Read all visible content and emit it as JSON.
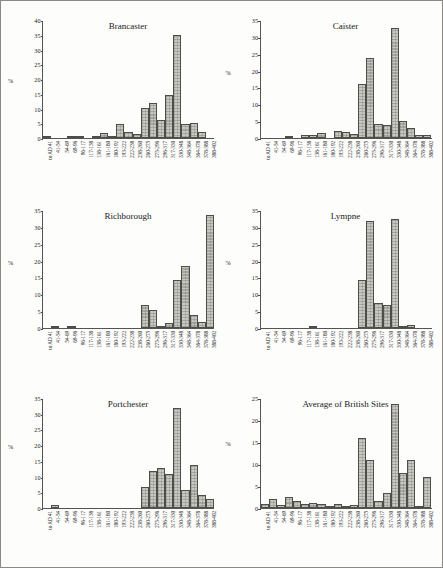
{
  "figure": {
    "background": "#fdfdfc",
    "border_color": "#8a8a82",
    "bar_fill": "#c8c8c2",
    "bar_edge": "#4e4e48",
    "axis_color": "#55554f"
  },
  "categories": [
    "to AD 41",
    "41-54",
    "54-69",
    "69-96",
    "96-117",
    "117-138",
    "138-161",
    "161-180",
    "180-192",
    "193-222",
    "222-238",
    "238-260",
    "260-275",
    "275-296",
    "296-317",
    "317-330",
    "330-348",
    "348-364",
    "364-378",
    "378-388",
    "388-402"
  ],
  "panels": [
    {
      "id": "brancaster",
      "title": "Brancaster",
      "ylabel": "%",
      "ylabel_at": 20,
      "ylim": [
        0,
        40
      ],
      "yticks": [
        0,
        5,
        10,
        15,
        20,
        25,
        30,
        35,
        40
      ],
      "values": [
        0.2,
        0,
        0,
        0.5,
        0.7,
        0,
        0.8,
        1.6,
        0.7,
        4.6,
        2.0,
        1.4,
        10.1,
        12.0,
        6.2,
        14.7,
        35.0,
        4.8,
        5.0,
        2.1,
        0
      ]
    },
    {
      "id": "caister",
      "title": "Caister",
      "ylabel": "%",
      "ylabel_at": 20,
      "ylim": [
        0,
        35
      ],
      "yticks": [
        0,
        5,
        10,
        15,
        20,
        25,
        30,
        35
      ],
      "values": [
        0,
        0,
        0,
        0.7,
        0,
        1.0,
        1.0,
        1.5,
        0,
        2.1,
        1.8,
        1.1,
        15.9,
        23.6,
        4.3,
        3.8,
        32.5,
        4.9,
        3.0,
        0.9,
        0.9
      ]
    },
    {
      "id": "richborough",
      "title": "Richborough",
      "ylabel": "%",
      "ylabel_at": 20,
      "ylim": [
        0,
        35
      ],
      "yticks": [
        0,
        5,
        10,
        15,
        20,
        25,
        30,
        35
      ],
      "values": [
        0,
        0.7,
        0,
        0.7,
        0,
        0,
        0,
        0,
        0,
        0,
        0,
        0,
        6.7,
        5.3,
        0.7,
        1.4,
        14.1,
        18.4,
        3.9,
        1.8,
        33.4
      ]
    },
    {
      "id": "lympne",
      "title": "Lympne",
      "ylabel": "%",
      "ylabel_at": 20,
      "ylim": [
        0,
        35
      ],
      "yticks": [
        0,
        5,
        10,
        15,
        20,
        25,
        30,
        35
      ],
      "values": [
        0,
        0,
        0,
        0,
        0,
        0,
        0.7,
        0,
        0,
        0,
        0,
        0,
        14.3,
        31.8,
        7.4,
        6.8,
        32.3,
        0.4,
        0.9,
        0,
        0
      ]
    },
    {
      "id": "portchester",
      "title": "Portchester",
      "ylabel": "%",
      "ylabel_at": 20,
      "ylim": [
        0,
        35
      ],
      "yticks": [
        0,
        5,
        10,
        15,
        20,
        25,
        30,
        35
      ],
      "values": [
        0,
        0.9,
        0,
        0,
        0,
        0,
        0,
        0,
        0,
        0,
        0,
        0,
        6.8,
        11.8,
        12.8,
        10.9,
        31.8,
        5.8,
        13.7,
        4.0,
        3.0
      ]
    },
    {
      "id": "average-of-british-sites",
      "title": "Average of British Sites",
      "ylabel": "%",
      "ylabel_at": 15,
      "ylim": [
        0,
        25
      ],
      "yticks": [
        0,
        5,
        10,
        15,
        20,
        25
      ],
      "values": [
        0.8,
        2.0,
        0.6,
        2.6,
        1.5,
        0.9,
        1.2,
        1.0,
        0.2,
        1.0,
        0.3,
        0.7,
        15.9,
        11.0,
        1.6,
        3.4,
        23.7,
        8.0,
        11.0,
        0.4,
        7.0
      ]
    }
  ],
  "chart_data": {
    "type": "bar",
    "xlabel": "",
    "ylabel": "%",
    "grid": false,
    "legend": "none",
    "categories": [
      "to AD 41",
      "41-54",
      "54-69",
      "69-96",
      "96-117",
      "117-138",
      "138-161",
      "161-180",
      "180-192",
      "193-222",
      "222-238",
      "238-260",
      "260-275",
      "275-296",
      "296-317",
      "317-330",
      "330-348",
      "348-364",
      "364-378",
      "378-388",
      "388-402"
    ],
    "series": [
      {
        "name": "Brancaster",
        "ylim": [
          0,
          40
        ],
        "values": [
          0.2,
          0,
          0,
          0.5,
          0.7,
          0,
          0.8,
          1.6,
          0.7,
          4.6,
          2.0,
          1.4,
          10.1,
          12.0,
          6.2,
          14.7,
          35.0,
          4.8,
          5.0,
          2.1,
          0
        ]
      },
      {
        "name": "Caister",
        "ylim": [
          0,
          35
        ],
        "values": [
          0,
          0,
          0,
          0.7,
          0,
          1.0,
          1.0,
          1.5,
          0,
          2.1,
          1.8,
          1.1,
          15.9,
          23.6,
          4.3,
          3.8,
          32.5,
          4.9,
          3.0,
          0.9,
          0.9
        ]
      },
      {
        "name": "Richborough",
        "ylim": [
          0,
          35
        ],
        "values": [
          0,
          0.7,
          0,
          0.7,
          0,
          0,
          0,
          0,
          0,
          0,
          0,
          0,
          6.7,
          5.3,
          0.7,
          1.4,
          14.1,
          18.4,
          3.9,
          1.8,
          33.4
        ]
      },
      {
        "name": "Lympne",
        "ylim": [
          0,
          35
        ],
        "values": [
          0,
          0,
          0,
          0,
          0,
          0,
          0.7,
          0,
          0,
          0,
          0,
          0,
          14.3,
          31.8,
          7.4,
          6.8,
          32.3,
          0.4,
          0.9,
          0,
          0
        ]
      },
      {
        "name": "Portchester",
        "ylim": [
          0,
          35
        ],
        "values": [
          0,
          0.9,
          0,
          0,
          0,
          0,
          0,
          0,
          0,
          0,
          0,
          0,
          6.8,
          11.8,
          12.8,
          10.9,
          31.8,
          5.8,
          13.7,
          4.0,
          3.0
        ]
      },
      {
        "name": "Average of British Sites",
        "ylim": [
          0,
          25
        ],
        "values": [
          0.8,
          2.0,
          0.6,
          2.6,
          1.5,
          0.9,
          1.2,
          1.0,
          0.2,
          1.0,
          0.3,
          0.7,
          15.9,
          11.0,
          1.6,
          3.4,
          23.7,
          8.0,
          11.0,
          0.4,
          7.0
        ]
      }
    ]
  }
}
